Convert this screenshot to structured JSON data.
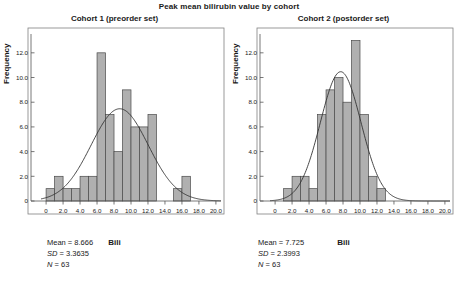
{
  "figure": {
    "title": "Peak mean bilirubin value by cohort"
  },
  "panels": [
    {
      "title": "Cohort 1 (preorder set)",
      "xlabel": "Bili",
      "ylabel": "Frequency",
      "stats": {
        "mean_label": "Mean = 8.666",
        "sd_prefix": "SD",
        "sd_value": " = 3.3635",
        "n_prefix": "N",
        "n_value": " = 63"
      }
    },
    {
      "title": "Cohort 2 (postorder set)",
      "xlabel": "Bili",
      "ylabel": "Frequency",
      "stats": {
        "mean_label": "Mean = 7.725",
        "sd_prefix": "SD",
        "sd_value": " = 2.3993",
        "n_prefix": "N",
        "n_value": " = 63"
      }
    }
  ],
  "chart_data": [
    {
      "type": "bar",
      "title": "Cohort 1 (preorder set)",
      "subtitle": "Peak mean bilirubin value by cohort",
      "xlabel": "Bili",
      "ylabel": "Frequency",
      "xlim": [
        -0.6,
        20.6
      ],
      "ylim": [
        0,
        13.2
      ],
      "xticks": [
        0,
        2,
        4,
        6,
        8,
        10,
        12,
        14,
        16,
        18,
        20
      ],
      "xticklabels": [
        "0",
        "2.0",
        "4.0",
        "6.0",
        "8.0",
        "10.0",
        "12.0",
        "14.0",
        "16.0",
        "18.0",
        "20.0"
      ],
      "yticks": [
        0,
        2,
        4,
        6,
        8,
        10,
        12
      ],
      "yticklabels": [
        "0",
        "2.0",
        "4.0",
        "6.0",
        "8.0",
        "10.0",
        "12.0"
      ],
      "grid": false,
      "legend": null,
      "bin_width": 1.0,
      "bin_starts": [
        0.0,
        1.0,
        2.0,
        3.0,
        4.0,
        5.0,
        6.0,
        7.0,
        8.0,
        9.0,
        10.0,
        11.0,
        12.0,
        15.0,
        16.0
      ],
      "values": [
        1,
        2,
        1,
        1,
        2,
        2,
        12,
        7,
        4,
        9,
        6,
        6,
        7,
        1,
        2
      ],
      "overlay": {
        "type": "normal-curve",
        "mean": 8.666,
        "sd": 3.3635,
        "n": 63,
        "peak_height": 7.47
      },
      "annotations": [
        "Mean = 8.666",
        "SD = 3.3635",
        "N = 63"
      ]
    },
    {
      "type": "bar",
      "title": "Cohort 2 (postorder set)",
      "subtitle": "Peak mean bilirubin value by cohort",
      "xlabel": "Bili",
      "ylabel": "Frequency",
      "xlim": [
        -0.6,
        20.6
      ],
      "ylim": [
        0,
        13.2
      ],
      "xticks": [
        0,
        2,
        4,
        6,
        8,
        10,
        12,
        14,
        16,
        18,
        20
      ],
      "xticklabels": [
        "0",
        "2.0",
        "4.0",
        "6.0",
        "8.0",
        "10.0",
        "12.0",
        "14.0",
        "16.0",
        "18.0",
        "20.0"
      ],
      "yticks": [
        0,
        2,
        4,
        6,
        8,
        10,
        12
      ],
      "yticklabels": [
        "0",
        "2.0",
        "4.0",
        "6.0",
        "8.0",
        "10.0",
        "12.0"
      ],
      "grid": false,
      "legend": null,
      "bin_width": 1.0,
      "bin_starts": [
        1.0,
        2.0,
        3.0,
        4.0,
        5.0,
        6.0,
        7.0,
        8.0,
        9.0,
        10.0,
        11.0,
        12.0
      ],
      "values": [
        1,
        2,
        2,
        1,
        7,
        9,
        10,
        8,
        13,
        7,
        2,
        1
      ],
      "overlay": {
        "type": "normal-curve",
        "mean": 7.725,
        "sd": 2.3993,
        "n": 63,
        "peak_height": 10.47
      },
      "annotations": [
        "Mean = 7.725",
        "SD = 2.3993",
        "N = 63"
      ]
    }
  ],
  "style": {
    "bar_fill": "#b0b0b0",
    "bar_stroke": "#4a4a4a",
    "curve_color": "#333333",
    "axis_color": "#555555",
    "frame_color": "#808080",
    "text_color": "#1a1a1a"
  }
}
